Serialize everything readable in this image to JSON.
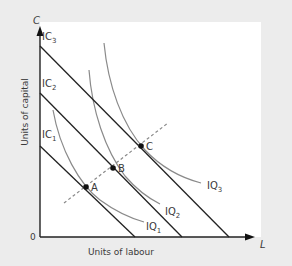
{
  "diagram": {
    "axes": {
      "y_symbol": "C",
      "x_symbol": "L",
      "origin": "0",
      "y_label": "Units of capital",
      "x_label": "Units of labour"
    },
    "isocosts": [
      {
        "name": "IC",
        "sub": "1"
      },
      {
        "name": "IC",
        "sub": "2"
      },
      {
        "name": "IC",
        "sub": "3"
      }
    ],
    "isoquants": [
      {
        "name": "IQ",
        "sub": "1"
      },
      {
        "name": "IQ",
        "sub": "2"
      },
      {
        "name": "IQ",
        "sub": "3"
      }
    ],
    "points": [
      {
        "label": "A"
      },
      {
        "label": "B"
      },
      {
        "label": "C"
      }
    ],
    "colors": {
      "background": "#ececec",
      "panel": "#ffffff",
      "axis": "#222222",
      "isocost": "#222222",
      "isoquant": "#8a8a8a",
      "path": "#8a8a8a",
      "text": "#3a3a3a"
    }
  }
}
